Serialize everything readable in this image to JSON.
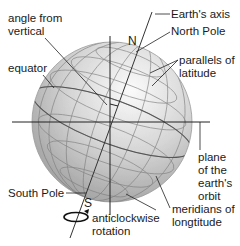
{
  "diagram": {
    "labels": {
      "angle_from_vertical": [
        "angle from",
        "vertical"
      ],
      "equator": "equator",
      "earths_axis": "Earth's axis",
      "north_pole": "North Pole",
      "parallels": [
        "parallels of",
        "latitude"
      ],
      "plane": [
        "plane",
        "of the",
        "earth's",
        "orbit"
      ],
      "south_pole": "South Pole",
      "rotation": [
        "anticlockwise",
        "rotation"
      ],
      "meridians": [
        "meridians of",
        "longtitude"
      ],
      "n": "N",
      "s": "S"
    },
    "colors": {
      "globe_light": "#f2f2f2",
      "globe_dark": "#8a8a8a",
      "line": "#222222"
    }
  }
}
